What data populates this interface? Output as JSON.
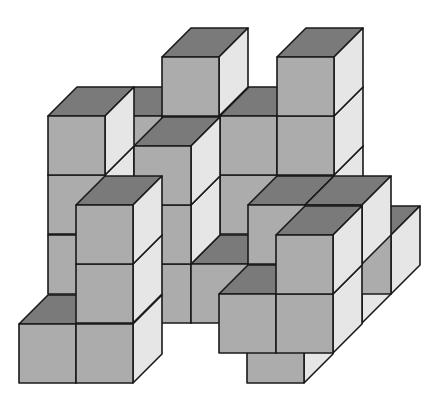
{
  "figure": {
    "title": "Isometric cube stack",
    "projection": {
      "cube_width": 57,
      "cube_height": 59,
      "depth_dx": 29,
      "depth_dy": 29
    },
    "colors": {
      "background": "#ffffff",
      "front_face": "#acacac",
      "top_face": "#7a7a7a",
      "side_face": "#e6e6e6",
      "edge": "#1a1a1a"
    },
    "cubes": [
      {
        "x": 105,
        "y": 116,
        "d": 2
      },
      {
        "x": 162,
        "y": 175,
        "d": 2
      },
      {
        "x": 162,
        "y": 116,
        "d": 2
      },
      {
        "x": 162,
        "y": 57,
        "d": 2
      },
      {
        "x": 220,
        "y": 175,
        "d": 2
      },
      {
        "x": 220,
        "y": 116,
        "d": 2
      },
      {
        "x": 277,
        "y": 175,
        "d": 2
      },
      {
        "x": 277,
        "y": 116,
        "d": 2
      },
      {
        "x": 277,
        "y": 57,
        "d": 2
      },
      {
        "x": 48,
        "y": 235,
        "d": 1
      },
      {
        "x": 48,
        "y": 175,
        "d": 1
      },
      {
        "x": 48,
        "y": 116,
        "d": 1
      },
      {
        "x": 134,
        "y": 264,
        "d": 1
      },
      {
        "x": 134,
        "y": 205,
        "d": 1
      },
      {
        "x": 134,
        "y": 146,
        "d": 1
      },
      {
        "x": 191,
        "y": 264,
        "d": 1
      },
      {
        "x": 248,
        "y": 264,
        "d": 1
      },
      {
        "x": 248,
        "y": 205,
        "d": 1
      },
      {
        "x": 334,
        "y": 235,
        "d": 1
      },
      {
        "x": 305,
        "y": 264,
        "d": 1
      },
      {
        "x": 305,
        "y": 205,
        "d": 1
      },
      {
        "x": 19,
        "y": 324,
        "d": 0
      },
      {
        "x": 76,
        "y": 324,
        "d": 0
      },
      {
        "x": 76,
        "y": 264,
        "d": 0
      },
      {
        "x": 76,
        "y": 205,
        "d": 0
      },
      {
        "x": 219,
        "y": 294,
        "d": 0
      },
      {
        "x": 276,
        "y": 294,
        "d": 0
      },
      {
        "x": 276,
        "y": 235,
        "d": 0
      },
      {
        "x": 247,
        "y": 324,
        "d": 0
      }
    ]
  }
}
